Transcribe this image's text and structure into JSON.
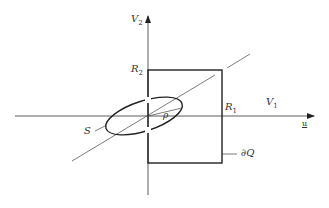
{
  "figure": {
    "labels": {
      "v2": {
        "base": "V",
        "sub": "2"
      },
      "v1": {
        "base": "V",
        "sub": "1"
      },
      "r2": {
        "base": "R",
        "sub": "2"
      },
      "r1": {
        "base": "R",
        "sub": "1"
      },
      "rho": "ρ",
      "s": "S",
      "dq": "∂Q",
      "u": "u"
    },
    "colors": {
      "line": "#222222",
      "thin": "#444444"
    }
  }
}
